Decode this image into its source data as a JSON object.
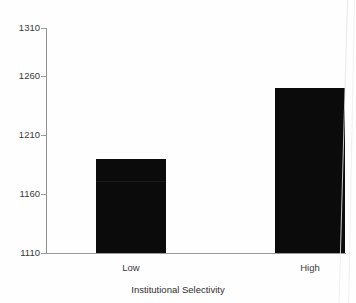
{
  "chart_data": {
    "type": "bar",
    "title": "",
    "xlabel": "Institutional Selectivity",
    "ylabel": "",
    "categories": [
      "Low",
      "High"
    ],
    "values": [
      1194,
      1257
    ],
    "ylim": [
      1110,
      1310
    ],
    "yticks": [
      1110,
      1160,
      1210,
      1260,
      1310
    ],
    "ytick_labels": [
      "1110",
      "1160",
      "1210",
      "1260",
      "1310"
    ],
    "grid": false,
    "legend": null,
    "bar_color": "#0b0b0b",
    "axis_color": "#9a9a9a",
    "background": "#fefefe"
  },
  "axes": {
    "y_tick_labels": [
      "1310",
      "1260",
      "1210",
      "1160",
      "1110"
    ],
    "x_tick_labels": [
      "Low",
      "High"
    ],
    "x_axis_title": "Institutional Selectivity"
  },
  "clipped_header": {
    "text": ""
  }
}
